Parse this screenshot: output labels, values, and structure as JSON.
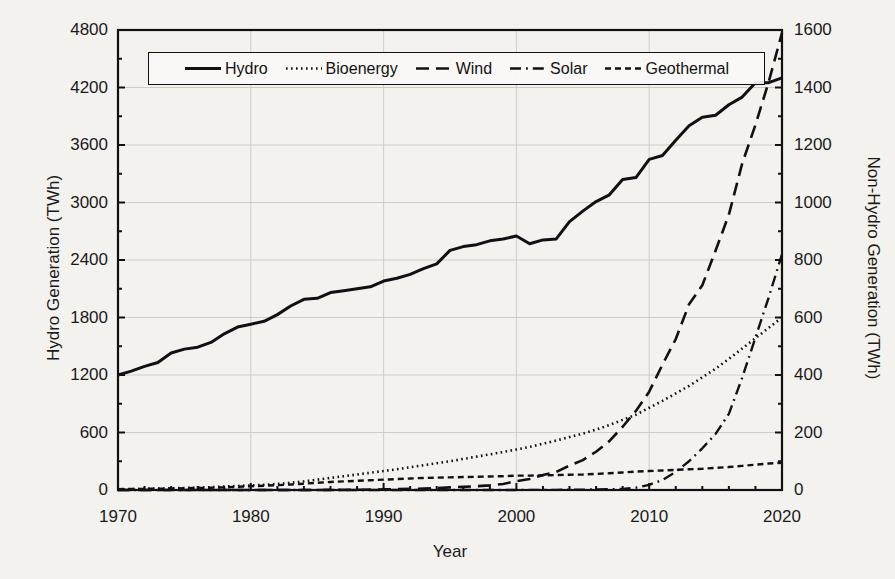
{
  "chart_data": {
    "type": "line",
    "title": "",
    "xlabel": "Year",
    "ylabel": "Hydro Generation (TWh)",
    "ylabel_secondary": "Non-Hydro Generation (TWh)",
    "xlim": [
      1970,
      2020
    ],
    "ylim": [
      0,
      4800
    ],
    "ylim_secondary": [
      0,
      1600
    ],
    "xticks": [
      1970,
      1980,
      1990,
      2000,
      2010,
      2020
    ],
    "xticklabels": [
      "1970",
      "1980",
      "1990",
      "2000",
      "2010",
      "2020"
    ],
    "yticks": [
      0,
      600,
      1200,
      1800,
      2400,
      3000,
      3600,
      4200,
      4800
    ],
    "yticklabels": [
      "0",
      "600",
      "1200",
      "1800",
      "2400",
      "3000",
      "3600",
      "4200",
      "4800"
    ],
    "yticks_secondary": [
      0,
      200,
      400,
      600,
      800,
      1000,
      1200,
      1400,
      1600
    ],
    "yticklabels_secondary": [
      "0",
      "200",
      "400",
      "600",
      "800",
      "1000",
      "1200",
      "1400",
      "1600"
    ],
    "minor_ticks": true,
    "grid": true,
    "legend_position": "upper-center",
    "x": [
      1970,
      1971,
      1972,
      1973,
      1974,
      1975,
      1976,
      1977,
      1978,
      1979,
      1980,
      1981,
      1982,
      1983,
      1984,
      1985,
      1986,
      1987,
      1988,
      1989,
      1990,
      1991,
      1992,
      1993,
      1994,
      1995,
      1996,
      1997,
      1998,
      1999,
      2000,
      2001,
      2002,
      2003,
      2004,
      2005,
      2006,
      2007,
      2008,
      2009,
      2010,
      2011,
      2012,
      2013,
      2014,
      2015,
      2016,
      2017,
      2018,
      2019,
      2020
    ],
    "series": [
      {
        "name": "Hydro",
        "axis": "left",
        "style": "solid",
        "units": "TWh",
        "values": [
          1200,
          1240,
          1290,
          1330,
          1430,
          1470,
          1490,
          1540,
          1630,
          1700,
          1730,
          1760,
          1830,
          1920,
          1990,
          2000,
          2060,
          2080,
          2100,
          2120,
          2180,
          2210,
          2250,
          2310,
          2360,
          2500,
          2540,
          2560,
          2600,
          2620,
          2650,
          2570,
          2610,
          2620,
          2800,
          2910,
          3010,
          3080,
          3240,
          3260,
          3450,
          3490,
          3650,
          3800,
          3890,
          3910,
          4020,
          4100,
          4250,
          4250,
          4300
        ]
      },
      {
        "name": "Bioenergy",
        "axis": "right",
        "style": "dotted",
        "units": "TWh",
        "values": [
          2,
          3,
          4,
          5,
          6,
          7,
          8,
          10,
          12,
          14,
          16,
          18,
          21,
          25,
          30,
          36,
          42,
          48,
          54,
          60,
          66,
          72,
          79,
          86,
          93,
          100,
          108,
          116,
          124,
          132,
          141,
          150,
          161,
          172,
          184,
          196,
          210,
          226,
          244,
          262,
          286,
          310,
          336,
          362,
          392,
          422,
          456,
          492,
          528,
          564,
          600
        ]
      },
      {
        "name": "Wind",
        "axis": "right",
        "style": "dashed",
        "units": "TWh",
        "values": [
          0,
          0,
          0,
          0,
          0,
          0,
          0,
          0,
          0,
          0,
          0,
          0,
          0,
          0,
          0,
          0.1,
          0.3,
          0.6,
          1,
          1.5,
          2.2,
          3,
          4,
          5,
          7,
          9,
          11,
          13,
          16,
          21,
          31,
          38,
          52,
          63,
          85,
          104,
          133,
          170,
          220,
          275,
          342,
          436,
          525,
          646,
          712,
          833,
          958,
          1135,
          1270,
          1420,
          1590
        ]
      },
      {
        "name": "Solar",
        "axis": "right",
        "style": "dashdot",
        "units": "TWh",
        "values": [
          0,
          0,
          0,
          0,
          0,
          0,
          0,
          0,
          0,
          0,
          0,
          0,
          0,
          0,
          0,
          0,
          0,
          0,
          0,
          0,
          0,
          0,
          0,
          0,
          0,
          0,
          0,
          0,
          0,
          0.1,
          0.2,
          0.3,
          0.4,
          0.6,
          0.8,
          1.2,
          1.7,
          2.5,
          4,
          8,
          18,
          35,
          63,
          100,
          145,
          195,
          265,
          390,
          530,
          670,
          820
        ]
      },
      {
        "name": "Geothermal",
        "axis": "right",
        "style": "shortdash",
        "units": "TWh",
        "values": [
          3,
          3.5,
          4,
          4.5,
          5,
          6,
          7,
          8,
          9,
          11,
          13,
          15,
          17,
          19,
          22,
          25,
          28,
          30,
          32,
          34,
          36,
          38,
          40,
          42,
          43,
          44,
          45,
          46,
          47,
          48,
          50,
          50,
          51,
          52,
          53,
          54,
          56,
          58,
          61,
          64,
          66,
          68,
          70,
          72,
          74,
          77,
          80,
          84,
          88,
          92,
          95
        ]
      }
    ]
  },
  "legend": {
    "items": [
      {
        "label": "Hydro",
        "style": "solid"
      },
      {
        "label": "Bioenergy",
        "style": "dotted"
      },
      {
        "label": "Wind",
        "style": "dashed"
      },
      {
        "label": "Solar",
        "style": "dashdot"
      },
      {
        "label": "Geothermal",
        "style": "shortdash"
      }
    ]
  },
  "colors": {
    "line": "#111111",
    "axis": "#111111",
    "grid": "#c9c9c4",
    "background": "#f3f2ef"
  }
}
